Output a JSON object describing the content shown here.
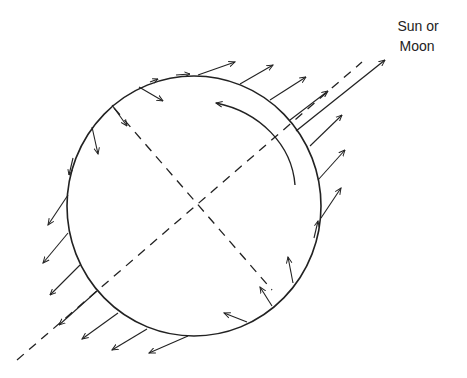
{
  "label": {
    "line1": "Sun or",
    "line2": "Moon"
  },
  "colors": {
    "stroke": "#222222",
    "background": "#ffffff"
  },
  "figure": {
    "elements": [
      "circle representing Earth",
      "dashed line toward Sun or Moon",
      "dashed perpendicular axis",
      "curved rotation arrow",
      "outward tidal force arrows on near and far sides",
      "inward and tangential force arrows around circle"
    ]
  }
}
